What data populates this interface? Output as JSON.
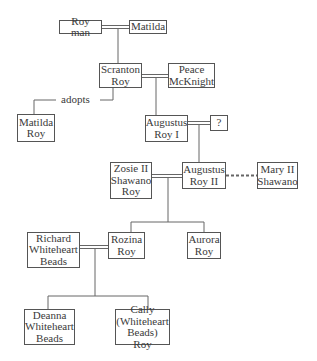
{
  "diagram": {
    "type": "family-tree",
    "people": [
      {
        "id": "roy_man",
        "label": "Roy man"
      },
      {
        "id": "matilda",
        "label": "Matilda"
      },
      {
        "id": "scranton",
        "label": "Scranton Roy"
      },
      {
        "id": "peace",
        "label": "Peace McKnight"
      },
      {
        "id": "matilda_roy",
        "label": "Matilda Roy"
      },
      {
        "id": "augustus1",
        "label": "Augustus Roy I"
      },
      {
        "id": "unknown",
        "label": "?"
      },
      {
        "id": "zosie",
        "label": "Zosie II Shawano Roy"
      },
      {
        "id": "augustus2",
        "label": "Augustus Roy II"
      },
      {
        "id": "mary2",
        "label": "Mary II Shawano"
      },
      {
        "id": "richard",
        "label": "Richard Whiteheart Beads"
      },
      {
        "id": "rozina",
        "label": "Rozina Roy"
      },
      {
        "id": "aurora",
        "label": "Aurora Roy"
      },
      {
        "id": "deanna",
        "label": "Deanna Whiteheart Beads"
      },
      {
        "id": "cally",
        "label": "Cally (Whiteheart Beads) Roy"
      }
    ],
    "relations": [
      {
        "type": "marriage",
        "a": "roy_man",
        "b": "matilda"
      },
      {
        "type": "child",
        "parents": [
          "roy_man",
          "matilda"
        ],
        "child": "scranton"
      },
      {
        "type": "marriage",
        "a": "scranton",
        "b": "peace"
      },
      {
        "type": "adoption",
        "parent": "scranton",
        "child": "matilda_roy",
        "label": "adopts"
      },
      {
        "type": "child",
        "parents": [
          "scranton",
          "peace"
        ],
        "child": "augustus1"
      },
      {
        "type": "marriage",
        "a": "augustus1",
        "b": "unknown"
      },
      {
        "type": "child",
        "parents": [
          "augustus1",
          "unknown"
        ],
        "child": "augustus2"
      },
      {
        "type": "marriage",
        "a": "zosie",
        "b": "augustus2"
      },
      {
        "type": "liaison",
        "a": "augustus2",
        "b": "mary2",
        "style": "dashed"
      },
      {
        "type": "child",
        "parents": [
          "zosie",
          "augustus2"
        ],
        "child": "rozina"
      },
      {
        "type": "child",
        "parents": [
          "zosie",
          "augustus2"
        ],
        "child": "aurora"
      },
      {
        "type": "marriage",
        "a": "richard",
        "b": "rozina"
      },
      {
        "type": "child",
        "parents": [
          "richard",
          "rozina"
        ],
        "child": "deanna"
      },
      {
        "type": "child",
        "parents": [
          "richard",
          "rozina"
        ],
        "child": "cally"
      }
    ],
    "adopt_label": "adopts"
  },
  "boxes": {
    "roy_man": [
      "Roy man"
    ],
    "matilda": [
      "Matilda"
    ],
    "scranton": [
      "Scranton",
      "Roy"
    ],
    "peace": [
      "Peace",
      "McKnight"
    ],
    "matilda_roy": [
      "Matilda",
      "Roy"
    ],
    "augustus1": [
      "Augustus",
      "Roy I"
    ],
    "unknown": [
      "?"
    ],
    "zosie": [
      "Zosie II",
      "Shawano",
      "Roy"
    ],
    "augustus2": [
      "Augustus",
      "Roy II"
    ],
    "mary2": [
      "Mary II",
      "Shawano"
    ],
    "richard": [
      "Richard",
      "Whiteheart",
      "Beads"
    ],
    "rozina": [
      "Rozina",
      "Roy"
    ],
    "aurora": [
      "Aurora",
      "Roy"
    ],
    "deanna": [
      "Deanna",
      "Whiteheart",
      "Beads"
    ],
    "cally": [
      "Cally",
      "(Whiteheart",
      "Beads) Roy"
    ]
  }
}
